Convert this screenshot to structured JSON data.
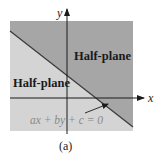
{
  "figure": {
    "caption": "(a)",
    "colors": {
      "upper_region": "#a6a6a6",
      "lower_region": "#d4d4d4",
      "boundary_line": "#3a3a3a",
      "axes": "#1a1a1a",
      "equation_text": "#8a8a8a"
    },
    "axes": {
      "x_label": "x",
      "y_label": "y"
    },
    "regions": {
      "upper_label": "Half-plane",
      "lower_label": "Half-plane"
    },
    "boundary": {
      "equation": "ax + by + c = 0"
    }
  }
}
